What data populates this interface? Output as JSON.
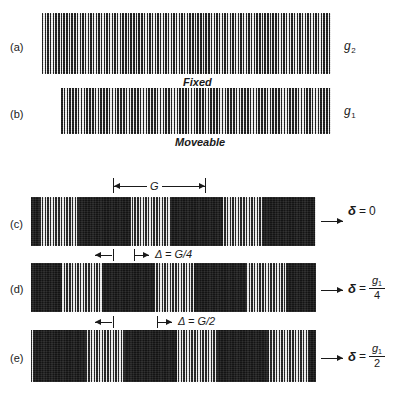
{
  "figure": {
    "background_color": "#ffffff",
    "ink_color": "#1a1a1a"
  },
  "panels": [
    {
      "id": "a",
      "label": "(a)",
      "caption": "Fixed",
      "grating_label_base": "g",
      "grating_label_sub": "2",
      "role": "fixed-grating",
      "line_count": 108,
      "has_moire": false
    },
    {
      "id": "b",
      "label": "(b)",
      "caption": "Moveable",
      "grating_label_base": "g",
      "grating_label_sub": "1",
      "role": "moveable-grating",
      "line_count": 96,
      "has_moire": false
    },
    {
      "id": "c",
      "label": "(c)",
      "caption": "",
      "role": "superimposed-gratings",
      "has_moire": true,
      "displacement_label": "δ = 0",
      "delta_symbol": "δ",
      "delta_equals": "=",
      "delta_value_simple": "0",
      "delta_numerator": "g",
      "delta_numerator_sub": "1",
      "delta_denominator": "",
      "fringe_count": 5,
      "fringe_phase": 0.0
    },
    {
      "id": "d",
      "label": "(d)",
      "caption": "",
      "role": "superimposed-gratings",
      "has_moire": true,
      "displacement_label": "δ = g1/4",
      "delta_symbol": "δ",
      "delta_equals": "=",
      "delta_value_simple": "",
      "delta_numerator": "g",
      "delta_numerator_sub": "1",
      "delta_denominator": "4",
      "fringe_count": 4,
      "fringe_phase": 0.25
    },
    {
      "id": "e",
      "label": "(e)",
      "caption": "",
      "role": "superimposed-gratings",
      "has_moire": true,
      "displacement_label": "δ = g1/2",
      "delta_symbol": "δ",
      "delta_equals": "=",
      "delta_value_simple": "",
      "delta_numerator": "g",
      "delta_numerator_sub": "1",
      "delta_denominator": "2",
      "fringe_count": 4,
      "fringe_phase": 0.5
    }
  ],
  "dimensions": {
    "fringe_pitch": {
      "label": "G",
      "symbol": "G",
      "description": "moire fringe period"
    },
    "shift_quarter": {
      "label": "Δ = G/4",
      "symbol": "Δ",
      "equals": "=",
      "value": "G/4"
    },
    "shift_half": {
      "label": "Δ = G/2",
      "symbol": "Δ",
      "equals": "=",
      "value": "G/2"
    }
  }
}
